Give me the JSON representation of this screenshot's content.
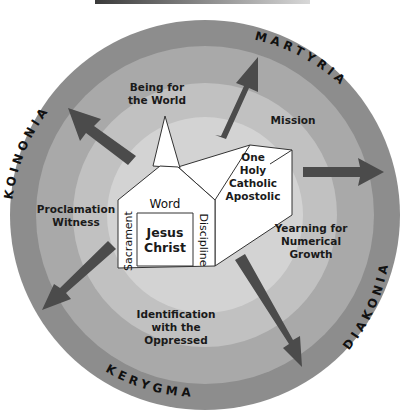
{
  "header_bar": {
    "color_start": "#3a3a3a",
    "color_end": "#d8d8d8"
  },
  "colors": {
    "ring_outer": "#8d8d8d",
    "ring_second": "#a9a9a9",
    "ring_third": "#c1c1c1",
    "ring_inner": "#d3d3d3",
    "arrow": "#4b4b4b",
    "building": "#ffffff",
    "outline": "#333333"
  },
  "outer_ring_labels": {
    "top_left": "KOINONIA",
    "top_right": "MARTYRIA",
    "bottom_right": "DIAKONIA",
    "bottom_left": "KERYGMA"
  },
  "zone_labels": {
    "being_for_world": [
      "Being for",
      "the World"
    ],
    "mission": [
      "Mission"
    ],
    "proclamation": [
      "Proclamation",
      "Witness"
    ],
    "yearning": [
      "Yearning for",
      "Numerical",
      "Growth"
    ],
    "identification": [
      "Identification",
      "with the",
      "Oppressed"
    ]
  },
  "church": {
    "marks": [
      "One",
      "Holy",
      "Catholic",
      "Apostolic"
    ],
    "top_label": "Word",
    "left_label": "Sacrament",
    "right_label": "Discipline",
    "center": [
      "Jesus",
      "Christ"
    ]
  },
  "arrows": [
    {
      "name": "arrow-koinonia",
      "direction": "up-left"
    },
    {
      "name": "arrow-martyria",
      "direction": "up-right"
    },
    {
      "name": "arrow-diakonia-right",
      "direction": "right"
    },
    {
      "name": "arrow-diakonia-down",
      "direction": "down-right"
    },
    {
      "name": "arrow-kerygma",
      "direction": "down-left"
    }
  ]
}
